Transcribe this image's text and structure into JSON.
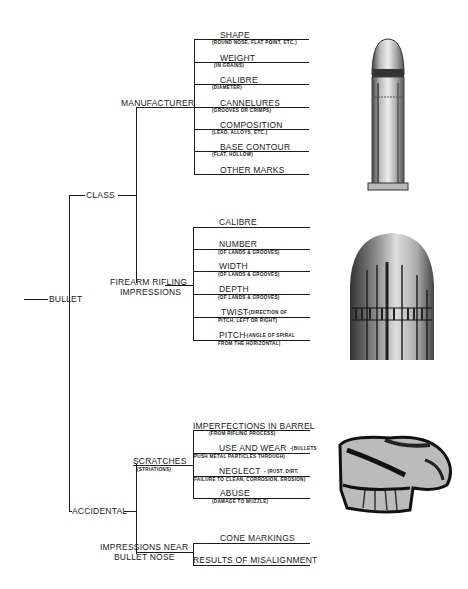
{
  "root": {
    "label": "BULLET"
  },
  "class": {
    "label": "CLASS",
    "manufacturer": {
      "label": "MANUFACTURER",
      "items": [
        {
          "label": "SHAPE",
          "sub": "(ROUND NOSE, FLAT POINT, ETC.)"
        },
        {
          "label": "WEIGHT",
          "sub": "(IN GRAINS)"
        },
        {
          "label": "CALIBRE",
          "sub": "(DIAMETER)"
        },
        {
          "label": "CANNELURES",
          "sub": "(GROOVES OR CRIMPS)"
        },
        {
          "label": "COMPOSITION",
          "sub": "(LEAD, ALLOYS, ETC.)"
        },
        {
          "label": "BASE CONTOUR",
          "sub": "(FLAT, HOLLOW)"
        },
        {
          "label": "OTHER MARKS",
          "sub": ""
        }
      ]
    },
    "rifling": {
      "label_line1": "FIREARM RIFLING",
      "label_line2": "IMPRESSIONS",
      "items": [
        {
          "label": "CALIBRE",
          "sub": ""
        },
        {
          "label": "NUMBER",
          "sub": "(OF LANDS & GROOVES)"
        },
        {
          "label": "WIDTH",
          "sub": "(OF LANDS & GROOVES)"
        },
        {
          "label": "DEPTH",
          "sub": "(OF LANDS & GROOVES)"
        },
        {
          "label": "TWIST",
          "inline": "-(DIRECTION OF",
          "sub": "PITCH, LEFT OR RIGHT)"
        },
        {
          "label": "PITCH",
          "inline": "-(ANGLE OF SPIRAL",
          "sub": "FROM THE HORIZONTAL)"
        }
      ]
    }
  },
  "accidental": {
    "label": "ACCIDENTAL",
    "scratches": {
      "label": "SCRATCHES",
      "sub": "(STRIATIONS)",
      "items": [
        {
          "label": "IMPERFECTIONS IN BARREL",
          "sub": "(FROM RIFLING PROCESS)"
        },
        {
          "label": "USE AND WEAR",
          "inline": "-(BULLETS",
          "sub": "PUSH METAL PARTICLES THROUGH)"
        },
        {
          "label": "NEGLECT",
          "inline": "- (RUST, DIRT,",
          "sub": "FAILURE TO CLEAN, CORROSION, EROSION)"
        },
        {
          "label": "ABUSE",
          "sub": "(DAMAGE TO MUZZLE)"
        }
      ]
    },
    "nose": {
      "label_line1": "IMPRESSIONS NEAR",
      "label_line2": "BULLET NOSE",
      "items": [
        {
          "label": "CONE MARKINGS"
        },
        {
          "label": "RESULTS OF MISALIGNMENT"
        }
      ]
    }
  },
  "images": [
    {
      "name": "cartridge-photo",
      "desc": "cartridge"
    },
    {
      "name": "bullet-rifling-photo",
      "desc": "bullet with rifling marks"
    },
    {
      "name": "deformed-bullet-photo",
      "desc": "deformed bullet"
    }
  ]
}
